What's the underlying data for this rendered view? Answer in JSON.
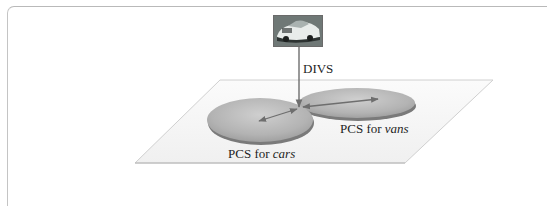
{
  "figure": {
    "query_image": {
      "icon": "car-photo-icon",
      "description": "photo of a car"
    },
    "arrow_label": "DIVS",
    "regions": [
      {
        "id": "cars",
        "label_prefix": "PCS for ",
        "label_emphasis": "cars"
      },
      {
        "id": "vans",
        "label_prefix": "PCS for ",
        "label_emphasis": "vans"
      }
    ]
  },
  "colors": {
    "ellipse_fill": "#b4b4b4",
    "ellipse_shadow": "#7a7a7a",
    "arrow": "#6e6e6e",
    "plane_edge": "#c8c8c8",
    "frame": "#bdbdbd"
  }
}
